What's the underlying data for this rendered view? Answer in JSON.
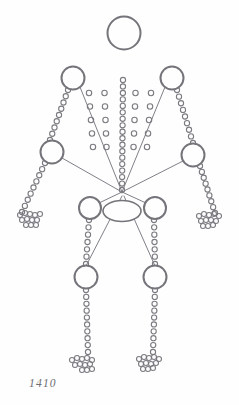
{
  "figure": {
    "caption": "1410",
    "background_color": "#fefefe",
    "stroke_color": "#74747a",
    "dot_stroke_color": "#7a7a80",
    "line_color": "#70707a",
    "caption_color": "#6e6e72"
  },
  "joints": [
    {
      "name": "head",
      "cx": 124,
      "cy": 33,
      "r": 16.5,
      "stroke_width": 2.0
    },
    {
      "name": "shoulder-left",
      "cx": 73,
      "cy": 78,
      "r": 11.5,
      "stroke_width": 2.0
    },
    {
      "name": "shoulder-right",
      "cx": 172,
      "cy": 78,
      "r": 11.5,
      "stroke_width": 2.0
    },
    {
      "name": "elbow-left",
      "cx": 52,
      "cy": 152,
      "r": 11.5,
      "stroke_width": 2.0
    },
    {
      "name": "elbow-right",
      "cx": 193,
      "cy": 155,
      "r": 11.5,
      "stroke_width": 2.0
    },
    {
      "name": "hip-left",
      "cx": 90,
      "cy": 208,
      "r": 11.0,
      "stroke_width": 2.0
    },
    {
      "name": "hip-right",
      "cx": 155,
      "cy": 208,
      "r": 11.0,
      "stroke_width": 2.0
    },
    {
      "name": "knee-left",
      "cx": 86,
      "cy": 277,
      "r": 11.5,
      "stroke_width": 2.0
    },
    {
      "name": "knee-right",
      "cx": 155,
      "cy": 277,
      "r": 11.5,
      "stroke_width": 2.0
    }
  ],
  "pelvis_ellipse": {
    "name": "pelvis",
    "cx": 122,
    "cy": 211,
    "rx": 19,
    "ry": 10.5,
    "stroke_width": 1.6
  },
  "convergence_point": {
    "x": 122,
    "y": 192
  },
  "radiating_lines": [
    {
      "name": "line-shoulder-left",
      "x1": 80,
      "y1": 87,
      "x2": 122,
      "y2": 192
    },
    {
      "name": "line-shoulder-right",
      "x1": 165,
      "y1": 87,
      "x2": 122,
      "y2": 192
    },
    {
      "name": "line-elbow-left",
      "x1": 62,
      "y1": 158,
      "x2": 122,
      "y2": 192
    },
    {
      "name": "line-elbow-right",
      "x1": 183,
      "y1": 161,
      "x2": 122,
      "y2": 192
    },
    {
      "name": "line-hip-left",
      "x1": 99,
      "y1": 203,
      "x2": 122,
      "y2": 192
    },
    {
      "name": "line-hip-right",
      "x1": 146,
      "y1": 203,
      "x2": 122,
      "y2": 192
    },
    {
      "name": "line-knee-left",
      "x1": 86,
      "y1": 266,
      "x2": 122,
      "y2": 196
    },
    {
      "name": "line-knee-right",
      "x1": 155,
      "y1": 266,
      "x2": 124,
      "y2": 196
    }
  ],
  "dotted_chains": [
    {
      "name": "upper-arm-left",
      "x1": 68,
      "y1": 90,
      "x2": 50,
      "y2": 140,
      "count": 9,
      "r": 2.6
    },
    {
      "name": "upper-arm-right",
      "x1": 177,
      "y1": 90,
      "x2": 193,
      "y2": 143,
      "count": 9,
      "r": 2.6
    },
    {
      "name": "forearm-left",
      "x1": 45,
      "y1": 163,
      "x2": 22,
      "y2": 212,
      "count": 9,
      "r": 2.6
    },
    {
      "name": "forearm-right",
      "x1": 200,
      "y1": 166,
      "x2": 215,
      "y2": 213,
      "count": 9,
      "r": 2.6
    },
    {
      "name": "thigh-left",
      "x1": 89,
      "y1": 220,
      "x2": 86,
      "y2": 264,
      "count": 7,
      "r": 2.6
    },
    {
      "name": "thigh-right",
      "x1": 154,
      "y1": 220,
      "x2": 155,
      "y2": 264,
      "count": 7,
      "r": 2.6
    },
    {
      "name": "shin-left",
      "x1": 86,
      "y1": 290,
      "x2": 88,
      "y2": 352,
      "count": 10,
      "r": 2.6
    },
    {
      "name": "shin-right",
      "x1": 155,
      "y1": 290,
      "x2": 153,
      "y2": 352,
      "count": 10,
      "r": 2.6
    },
    {
      "name": "spine",
      "x1": 123,
      "y1": 80,
      "x2": 122,
      "y2": 190,
      "count": 18,
      "r": 2.6
    }
  ],
  "torso_grid": {
    "name": "torso-dot-grid",
    "origin_x": 96,
    "origin_y": 93,
    "col_step": 15.5,
    "row_step": 13.5,
    "cols": 5,
    "rows": 5,
    "r": 2.7,
    "skip_col": 2,
    "taper": 1.6
  },
  "extremity_clusters": [
    {
      "name": "hand-left",
      "dots": [
        [
          20,
          215
        ],
        [
          25,
          213
        ],
        [
          30,
          214
        ],
        [
          35,
          215
        ],
        [
          40,
          214
        ],
        [
          22,
          220
        ],
        [
          27,
          219
        ],
        [
          32,
          220
        ],
        [
          37,
          220
        ],
        [
          26,
          225
        ],
        [
          31,
          225
        ],
        [
          36,
          225
        ]
      ],
      "r": 2.5
    },
    {
      "name": "hand-right",
      "dots": [
        [
          199,
          216
        ],
        [
          204,
          214
        ],
        [
          209,
          215
        ],
        [
          214,
          214
        ],
        [
          219,
          216
        ],
        [
          201,
          221
        ],
        [
          206,
          220
        ],
        [
          211,
          220
        ],
        [
          216,
          221
        ],
        [
          203,
          226
        ],
        [
          208,
          226
        ],
        [
          213,
          225
        ]
      ],
      "r": 2.5
    },
    {
      "name": "foot-left",
      "dots": [
        [
          72,
          360
        ],
        [
          77,
          358
        ],
        [
          82,
          359
        ],
        [
          87,
          358
        ],
        [
          92,
          360
        ],
        [
          75,
          365
        ],
        [
          80,
          364
        ],
        [
          85,
          365
        ],
        [
          90,
          364
        ],
        [
          82,
          370
        ],
        [
          87,
          370
        ],
        [
          92,
          369
        ]
      ],
      "r": 2.5
    },
    {
      "name": "foot-right",
      "dots": [
        [
          139,
          359
        ],
        [
          144,
          357
        ],
        [
          149,
          358
        ],
        [
          154,
          357
        ],
        [
          159,
          359
        ],
        [
          141,
          364
        ],
        [
          146,
          363
        ],
        [
          151,
          364
        ],
        [
          156,
          363
        ],
        [
          143,
          369
        ],
        [
          148,
          369
        ],
        [
          153,
          368
        ]
      ],
      "r": 2.5
    }
  ]
}
